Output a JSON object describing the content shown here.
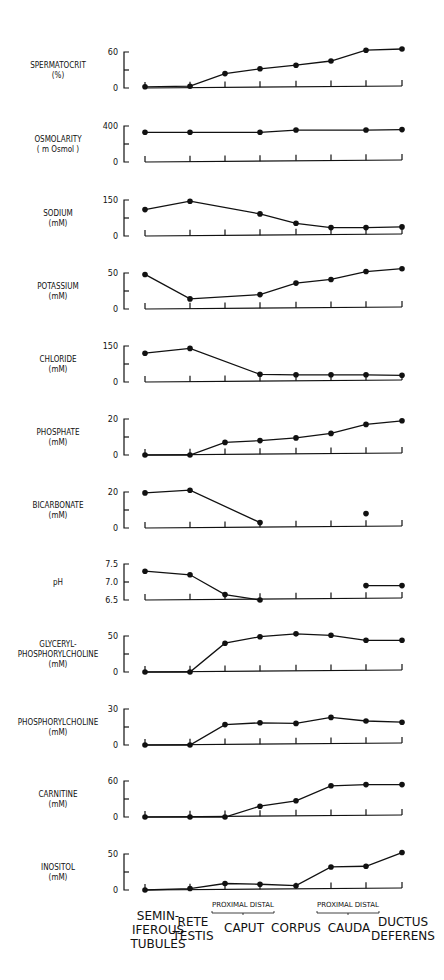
{
  "chart_data": {
    "type": "line",
    "title": "",
    "xlabel": "",
    "categories": [
      "SEMINIFEROUS TUBULES",
      "RETE TESTIS",
      "PROXIMAL CAPUT",
      "DISTAL CAPUT",
      "CORPUS",
      "PROXIMAL CAUDA",
      "DISTAL CAUDA",
      "DUCTUS DEFERENS"
    ],
    "x_group_labels": [
      {
        "label": "SEMIN-\nIFEROUS\nTUBULES",
        "lines": [
          "SEMIN-",
          "IFEROUS",
          "TUBULES"
        ]
      },
      {
        "label": "RETE\nTESTIS",
        "lines": [
          "RETE",
          "TESTIS"
        ]
      },
      {
        "label": "CAPUT",
        "lines": [
          "CAPUT"
        ],
        "sub": [
          "PROXIMAL",
          "DISTAL"
        ]
      },
      {
        "label": "CORPUS",
        "lines": [
          "CORPUS"
        ]
      },
      {
        "label": "CAUDA",
        "lines": [
          "CAUDA"
        ],
        "sub": [
          "PROXIMAL",
          "DISTAL"
        ]
      },
      {
        "label": "DUCTUS\nDEFERENS",
        "lines": [
          "DUCTUS",
          "DEFERENS"
        ]
      }
    ],
    "series": [
      {
        "name": "SPERMATOCRIT",
        "unit": "(%)",
        "ylim": [
          0,
          60
        ],
        "yticks": [
          "0",
          "60"
        ],
        "values": [
          2,
          3,
          24,
          32,
          38,
          45,
          63,
          65
        ]
      },
      {
        "name": "OSMOLARITY",
        "unit": "( m Osmol )",
        "ylim": [
          0,
          400
        ],
        "yticks": [
          "0",
          "400"
        ],
        "values": [
          330,
          330,
          null,
          330,
          355,
          null,
          355,
          360
        ]
      },
      {
        "name": "SODIUM",
        "unit": "(mM)",
        "ylim": [
          0,
          150
        ],
        "yticks": [
          "0",
          "150"
        ],
        "values": [
          110,
          145,
          null,
          92,
          53,
          35,
          35,
          38
        ]
      },
      {
        "name": "POTASSIUM",
        "unit": "(mM)",
        "ylim": [
          0,
          50
        ],
        "yticks": [
          "0",
          "50"
        ],
        "values": [
          48,
          14,
          null,
          20,
          36,
          41,
          52,
          56
        ]
      },
      {
        "name": "CHLORIDE",
        "unit": "(mM)",
        "ylim": [
          0,
          150
        ],
        "yticks": [
          "0",
          "150"
        ],
        "values": [
          120,
          140,
          null,
          32,
          30,
          30,
          30,
          28
        ]
      },
      {
        "name": "PHOSPHATE",
        "unit": "(mM)",
        "ylim": [
          0,
          20
        ],
        "yticks": [
          "0",
          "20"
        ],
        "values": [
          0,
          0,
          7,
          8,
          9.5,
          12,
          17,
          19
        ]
      },
      {
        "name": "BICARBONATE",
        "unit": "(mM)",
        "ylim": [
          0,
          20
        ],
        "yticks": [
          "0",
          "20"
        ],
        "values": [
          19.5,
          21,
          null,
          3,
          null,
          null,
          8,
          null
        ],
        "connected_through": 3
      },
      {
        "name": "pH",
        "unit": "",
        "ylim": [
          6.5,
          7.5
        ],
        "yticks": [
          "6.5",
          "7.0",
          "7.5"
        ],
        "values": [
          7.3,
          7.2,
          6.65,
          6.5,
          null,
          null,
          6.9,
          6.9
        ]
      },
      {
        "name": "GLYCERYL-PHOSPHORYLCHOLINE",
        "unit": "(mM)",
        "ylim": [
          0,
          50
        ],
        "yticks": [
          "0",
          "50"
        ],
        "values": [
          0,
          0,
          40,
          49,
          53,
          51,
          44,
          44
        ]
      },
      {
        "name": "PHOSPHORYLCHOLINE",
        "unit": "(mM)",
        "ylim": [
          0,
          30
        ],
        "yticks": [
          "0",
          "30"
        ],
        "values": [
          0,
          0,
          17,
          18.5,
          18,
          23,
          20,
          19
        ]
      },
      {
        "name": "CARNITINE",
        "unit": "(mM)",
        "ylim": [
          0,
          60
        ],
        "yticks": [
          "0",
          "60"
        ],
        "values": [
          0,
          0,
          0,
          18,
          27,
          52,
          54,
          54
        ]
      },
      {
        "name": "INOSITOL",
        "unit": "(mM)",
        "ylim": [
          0,
          50
        ],
        "yticks": [
          "0",
          "50"
        ],
        "values": [
          0,
          2,
          9,
          8,
          6,
          32,
          33,
          52
        ]
      }
    ]
  },
  "panels": [
    {
      "label_lines": [
        "SPERMATOCRIT",
        "(%)"
      ],
      "top": 52,
      "zero": 88
    },
    {
      "label_lines": [
        "OSMOLARITY",
        "( m Osmol )"
      ],
      "top": 126,
      "zero": 162
    },
    {
      "label_lines": [
        "SODIUM",
        "(mM)"
      ],
      "top": 200,
      "zero": 236
    },
    {
      "label_lines": [
        "POTASSIUM",
        "(mM)"
      ],
      "top": 273,
      "zero": 309
    },
    {
      "label_lines": [
        "CHLORIDE",
        "(mM)"
      ],
      "top": 346,
      "zero": 382
    },
    {
      "label_lines": [
        "PHOSPHATE",
        "(mM)"
      ],
      "top": 419,
      "zero": 455
    },
    {
      "label_lines": [
        "BICARBONATE",
        "(mM)"
      ],
      "top": 492,
      "zero": 528
    },
    {
      "label_lines": [
        "pH"
      ],
      "top": 564,
      "zero": 600
    },
    {
      "label_lines": [
        "GLYCERYL-",
        "PHOSPHORYLCHOLINE",
        "(mM)"
      ],
      "top": 636,
      "zero": 672
    },
    {
      "label_lines": [
        "PHOSPHORYLCHOLINE",
        "(mM)"
      ],
      "top": 709,
      "zero": 745
    },
    {
      "label_lines": [
        "CARNITINE",
        "(mM)"
      ],
      "top": 781,
      "zero": 817
    },
    {
      "label_lines": [
        "INOSITOL",
        "(mM)"
      ],
      "top": 854,
      "zero": 890
    }
  ],
  "x_positions": [
    145,
    190,
    225,
    260,
    296,
    331,
    366,
    402
  ],
  "colors": {
    "ink": "#111111",
    "paper": "#ffffff"
  }
}
